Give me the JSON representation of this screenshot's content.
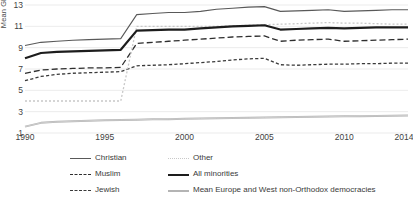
{
  "chart_data": {
    "type": "line",
    "title": "",
    "xlabel": "",
    "ylabel": "Mean GRD",
    "xlim": [
      1990,
      2014
    ],
    "ylim": [
      1,
      13
    ],
    "yticks": [
      1,
      3,
      5,
      7,
      9,
      11,
      13
    ],
    "xticks": [
      1990,
      1995,
      2000,
      2005,
      2010,
      2014
    ],
    "grid": "horizontal",
    "legend_position": "bottom",
    "x": [
      1990,
      1991,
      1992,
      1993,
      1994,
      1995,
      1996,
      1997,
      1998,
      1999,
      2000,
      2001,
      2002,
      2003,
      2004,
      2005,
      2006,
      2007,
      2008,
      2009,
      2010,
      2011,
      2012,
      2013,
      2014
    ],
    "series": [
      {
        "name": "Christian",
        "style": "solid-thin",
        "color": "#595959",
        "values": [
          9.2,
          9.5,
          9.6,
          9.7,
          9.75,
          9.8,
          9.85,
          12.1,
          12.2,
          12.3,
          12.3,
          12.4,
          12.6,
          12.7,
          12.8,
          12.85,
          12.4,
          12.45,
          12.5,
          12.55,
          12.4,
          12.45,
          12.5,
          12.55,
          12.55
        ]
      },
      {
        "name": "Muslim",
        "style": "long-dash",
        "color": "#2e2e2e",
        "values": [
          6.6,
          6.9,
          7.0,
          7.05,
          7.1,
          7.1,
          7.15,
          9.4,
          9.5,
          9.6,
          9.7,
          9.8,
          9.9,
          10.0,
          10.05,
          10.1,
          9.6,
          9.7,
          9.75,
          9.8,
          9.6,
          9.65,
          9.7,
          9.75,
          9.8
        ]
      },
      {
        "name": "Jewish",
        "style": "short-dash",
        "color": "#3a3a3a",
        "values": [
          5.9,
          6.3,
          6.5,
          6.6,
          6.65,
          6.7,
          6.75,
          7.3,
          7.35,
          7.4,
          7.5,
          7.6,
          7.7,
          7.85,
          7.95,
          8.0,
          7.4,
          7.35,
          7.4,
          7.45,
          7.45,
          7.5,
          7.5,
          7.55,
          7.55
        ]
      },
      {
        "name": "Other",
        "style": "dotted",
        "color": "#c8c8c8",
        "values": [
          4.0,
          4.0,
          4.0,
          4.0,
          4.0,
          4.0,
          4.0,
          11.0,
          11.0,
          11.0,
          11.0,
          11.0,
          11.0,
          11.05,
          11.1,
          11.15,
          11.2,
          11.25,
          11.3,
          11.35,
          11.3,
          11.3,
          11.25,
          11.2,
          11.2
        ]
      },
      {
        "name": "All minorities",
        "style": "solid-thick",
        "color": "#1d1d1d",
        "values": [
          8.0,
          8.5,
          8.6,
          8.65,
          8.7,
          8.75,
          8.8,
          10.6,
          10.65,
          10.7,
          10.7,
          10.8,
          10.9,
          11.0,
          11.05,
          11.1,
          10.7,
          10.75,
          10.8,
          10.85,
          10.8,
          10.85,
          10.9,
          10.9,
          10.9
        ]
      },
      {
        "name": "Mean Europe and West non-Orthodox democracies",
        "style": "solid-gray",
        "color": "#b4b4b4",
        "values": [
          1.6,
          1.95,
          2.05,
          2.1,
          2.15,
          2.2,
          2.22,
          2.25,
          2.28,
          2.3,
          2.33,
          2.36,
          2.38,
          2.4,
          2.42,
          2.45,
          2.47,
          2.5,
          2.52,
          2.54,
          2.56,
          2.58,
          2.6,
          2.62,
          2.64
        ]
      }
    ]
  },
  "legend": {
    "items": [
      {
        "label": "Christian",
        "style": "solid-thin"
      },
      {
        "label": "Other",
        "style": "dotted"
      },
      {
        "label": "Muslim",
        "style": "long-dash"
      },
      {
        "label": "All minorities",
        "style": "solid-thick"
      },
      {
        "label": "Jewish",
        "style": "short-dash"
      },
      {
        "label": "Mean Europe and West non-Orthodox democracies",
        "style": "solid-gray"
      }
    ]
  },
  "axis": {
    "y_title": "Mean GRD",
    "y_labels": [
      "13",
      "11",
      "9",
      "7",
      "5",
      "3",
      "1"
    ],
    "x_labels": [
      "1990",
      "1995",
      "2000",
      "2005",
      "2010",
      "2014"
    ]
  }
}
